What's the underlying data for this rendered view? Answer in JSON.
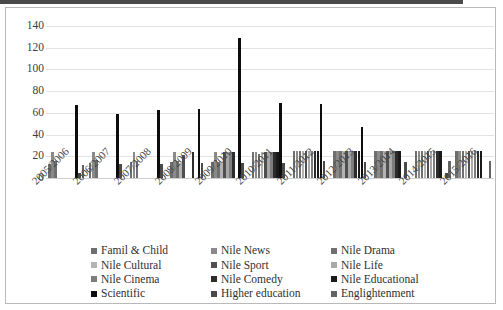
{
  "chart_data": {
    "type": "bar",
    "title": "",
    "subtitle": "",
    "xlabel": "",
    "ylabel": "",
    "ylim": [
      0,
      140
    ],
    "yticks": [
      0,
      20,
      40,
      60,
      80,
      100,
      120,
      140
    ],
    "grid": true,
    "legend_position": "bottom",
    "categories": [
      "2005/2006",
      "2006/2007",
      "2007/2008",
      "2008/2009",
      "2009/2010",
      "2010/2011",
      "2011/2012",
      "2012/2013",
      "2013/2014",
      "2014/2015",
      "2015/2016"
    ],
    "series": [
      {
        "name": "Famil & Child",
        "color": "#6e6e6e",
        "values": [
          13,
          14,
          15,
          15,
          15,
          24,
          25,
          25,
          25,
          25,
          25
        ]
      },
      {
        "name": "Nile News",
        "color": "#8a8a8a",
        "values": [
          24,
          24,
          24,
          24,
          24,
          24,
          25,
          25,
          25,
          25,
          25
        ]
      },
      {
        "name": "Nile Drama",
        "color": "#707070",
        "values": [
          16,
          17,
          16,
          16,
          15,
          22,
          25,
          25,
          25,
          25,
          25
        ]
      },
      {
        "name": "Nile Cultural",
        "color": "#b3b3b3",
        "values": [
          0,
          0,
          0,
          14,
          15,
          24,
          25,
          25,
          25,
          25,
          25
        ]
      },
      {
        "name": "Nile Sport",
        "color": "#4f4f4f",
        "values": [
          0,
          0,
          0,
          21,
          24,
          24,
          25,
          25,
          25,
          25,
          25
        ]
      },
      {
        "name": "Nile Life",
        "color": "#a8a8a8",
        "values": [
          0,
          0,
          0,
          0,
          24,
          24,
          25,
          25,
          25,
          25,
          25
        ]
      },
      {
        "name": "Nile Cinema",
        "color": "#7d7d7d",
        "values": [
          0,
          0,
          0,
          0,
          24,
          24,
          25,
          25,
          25,
          25,
          25
        ]
      },
      {
        "name": "Nile Comedy",
        "color": "#2c2c2c",
        "values": [
          0,
          0,
          0,
          24,
          24,
          24,
          25,
          25,
          25,
          25,
          25
        ]
      },
      {
        "name": "Nile Educational",
        "color": "#1a1a1a",
        "values": [
          0,
          0,
          0,
          0,
          0,
          24,
          25,
          25,
          25,
          25,
          25
        ]
      },
      {
        "name": "Scientific",
        "color": "#0d0d0d",
        "values": [
          67,
          59,
          63,
          64,
          129,
          69,
          68,
          47,
          0,
          0,
          0
        ]
      },
      {
        "name": "Higher education",
        "color": "#4a4a4a",
        "values": [
          5,
          13,
          13,
          14,
          14,
          14,
          16,
          15,
          15,
          5,
          0
        ]
      },
      {
        "name": "Englightenment",
        "color": "#636363",
        "values": [
          12,
          0,
          0,
          0,
          0,
          0,
          0,
          0,
          0,
          16,
          16
        ]
      }
    ]
  },
  "legend": {
    "items": [
      {
        "label": "Famil & Child",
        "swatch": "#6e6e6e"
      },
      {
        "label": "Nile News",
        "swatch": "#8a8a8a"
      },
      {
        "label": "Nile Drama",
        "swatch": "#707070"
      },
      {
        "label": "Nile Cultural",
        "swatch": "#b3b3b3"
      },
      {
        "label": "Nile Sport",
        "swatch": "#4f4f4f"
      },
      {
        "label": "Nile Life",
        "swatch": "#a8a8a8"
      },
      {
        "label": "Nile Cinema",
        "swatch": "#7d7d7d"
      },
      {
        "label": "Nile Comedy",
        "swatch": "#2c2c2c"
      },
      {
        "label": "Nile Educational",
        "swatch": "#1a1a1a"
      },
      {
        "label": "Scientific",
        "swatch": "#0d0d0d"
      },
      {
        "label": "Higher education",
        "swatch": "#4a4a4a"
      },
      {
        "label": "Englightenment",
        "swatch": "#636363"
      }
    ]
  },
  "colors": {
    "background": "#ffffff",
    "frame": "#b9b9b9",
    "gridline": "#e2e2e2",
    "tick_text": "#3d3d3d",
    "legend_text": "#303030"
  }
}
